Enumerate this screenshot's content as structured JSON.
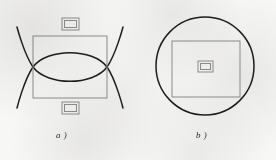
{
  "figure": {
    "background_color": "#f7f7f6",
    "stroke_dark": "#1e1e1e",
    "stroke_light": "#8f8f8f",
    "caption_color": "#2b2b2b",
    "panels": [
      {
        "id": "a",
        "caption": "a )",
        "description": "rectangle crossed by two large circular arcs forming a lens, with small nested rectangles above and below",
        "main_rect": {
          "x": 33,
          "y": 36,
          "width": 74,
          "height": 62
        },
        "arcs": [
          {
            "name": "upper-arc",
            "sweep": "concave-down",
            "crosses_left": true,
            "crosses_right": true
          },
          {
            "name": "lower-arc",
            "sweep": "concave-up",
            "crosses_left": true,
            "crosses_right": true
          }
        ],
        "crossings": [
          {
            "name": "left-crossing",
            "x": 33,
            "y": 67
          },
          {
            "name": "right-crossing",
            "x": 107,
            "y": 67
          }
        ],
        "small_rects": [
          {
            "name": "top-nested-rect",
            "x": 62,
            "y": 18,
            "width": 17,
            "height": 12
          },
          {
            "name": "bottom-nested-rect",
            "x": 62,
            "y": 102,
            "width": 17,
            "height": 12
          }
        ]
      },
      {
        "id": "b",
        "caption": "b )",
        "description": "circle containing a rectangle with a tiny nested rectangle at its centre",
        "circle": {
          "cx": 205,
          "cy": 66,
          "r": 49
        },
        "main_rect": {
          "x": 172,
          "y": 41,
          "width": 68,
          "height": 56
        },
        "small_rects": [
          {
            "name": "center-nested-rect",
            "x": 198,
            "y": 61,
            "width": 15,
            "height": 11
          }
        ]
      }
    ]
  }
}
